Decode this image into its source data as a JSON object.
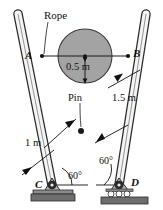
{
  "figure": {
    "type": "statics-diagram",
    "canvas": {
      "width": 163,
      "height": 210
    },
    "colors": {
      "cylinder_fill": "#a3a3a3",
      "cylinder_stroke": "#3a3a3a",
      "strut_fill": "#f2f2f2",
      "strut_stroke": "#2b2b2b",
      "ground_fill": "#6e6e6e",
      "base_plate_fill": "#8c8c8c",
      "line": "#1a1a1a",
      "text": "#111111"
    }
  },
  "labels": {
    "rope": "Rope",
    "point_a": "A",
    "point_b": "B",
    "diameter_dim": "0.5 m",
    "pin": "Pin",
    "length_right": "1.5 m",
    "length_left": "1 m",
    "angle_left": "60°",
    "angle_right": "60°",
    "point_c": "C",
    "point_d": "D"
  },
  "geometry": {
    "rope": {
      "x1": 42,
      "y1": 56,
      "x2": 128,
      "y2": 56
    },
    "cylinder": {
      "cx": 85,
      "cy": 56,
      "r": 27,
      "radius_m": 0.5
    },
    "pin": {
      "x": 81,
      "y": 131
    },
    "support_c": {
      "x": 52,
      "y": 185,
      "type": "pin-support"
    },
    "support_d": {
      "x": 119,
      "y": 185,
      "type": "roller-support"
    },
    "strut_left": {
      "from": "C",
      "to_top": [
        16,
        12
      ]
    },
    "strut_right": {
      "from": "D",
      "to_top": [
        148,
        12
      ]
    },
    "angles_deg": [
      60,
      60
    ],
    "lengths_m": [
      1,
      1.5
    ]
  }
}
